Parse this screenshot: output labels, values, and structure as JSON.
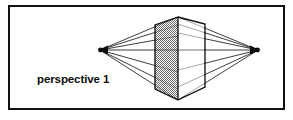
{
  "figure": {
    "caption": "perspective 1",
    "title": "perspective 1",
    "frame": {
      "x": 8,
      "y": 5,
      "width": 277,
      "height": 105,
      "border_color": "#111111",
      "border_width": 2,
      "background_color": "#ffffff"
    },
    "colors": {
      "line": "#0d0d0d",
      "shaded_face_fill": "#b0b0b0",
      "light_face_fill": "#ffffff",
      "text": "#0d0d0d",
      "background": "#ffffff"
    },
    "diagram": {
      "type": "two-point-perspective-construction",
      "vanishing_points": [
        {
          "name": "left-vanishing-point",
          "x": 100,
          "y": 50
        },
        {
          "name": "right-vanishing-point",
          "x": 258,
          "y": 50
        }
      ],
      "box": {
        "near_vertical_edge": {
          "x": 178,
          "top_y": 17,
          "bottom_y": 100
        },
        "left_back_edge": {
          "x": 155,
          "top_y": 25,
          "bottom_y": 89
        },
        "right_back_edge": {
          "x": 205,
          "top_y": 24,
          "bottom_y": 87
        },
        "left_face_shaded": true,
        "right_face_shaded": false
      }
    }
  }
}
